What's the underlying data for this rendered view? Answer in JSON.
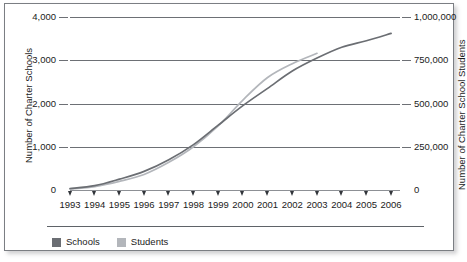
{
  "chart_data": {
    "type": "line",
    "title": "",
    "xlabel": "",
    "ylabel": "Number of Charter Schools",
    "y2label": "Number of Charter School Students",
    "grid": true,
    "legend_position": "bottom-left",
    "x": [
      1993,
      1994,
      1995,
      1996,
      1997,
      1998,
      1999,
      2000,
      2001,
      2002,
      2003,
      2004,
      2005,
      2006
    ],
    "xticklabels": [
      "1993",
      "1994",
      "1995",
      "1996",
      "1997",
      "1998",
      "1999",
      "2000",
      "2001",
      "2002",
      "2003",
      "2004",
      "2005",
      "2006"
    ],
    "ylim": [
      0,
      4000
    ],
    "yticks": [
      0,
      1000,
      2000,
      3000,
      4000
    ],
    "yticklabels": [
      "0",
      "1,000",
      "2,000",
      "3,000",
      "4,000"
    ],
    "y2lim": [
      0,
      1000000
    ],
    "y2ticks": [
      0,
      250000,
      500000,
      750000,
      1000000
    ],
    "y2ticklabels": [
      "0",
      "250,000",
      "500,000",
      "750,000",
      "1,000,000"
    ],
    "series": [
      {
        "name": "Schools",
        "axis": "left",
        "color": "#6b6e73",
        "values": [
          35,
          100,
          250,
          430,
          700,
          1050,
          1500,
          1950,
          2350,
          2750,
          3050,
          3300,
          3450,
          3620
        ]
      },
      {
        "name": "Students",
        "axis": "right",
        "color": "#b3b6bb",
        "values": [
          5000,
          20000,
          50000,
          90000,
          160000,
          250000,
          370000,
          520000,
          650000,
          730000,
          790000,
          null,
          null,
          null
        ]
      }
    ],
    "legend": [
      {
        "label": "Schools",
        "color": "#6b6e73"
      },
      {
        "label": "Students",
        "color": "#b3b6bb"
      }
    ]
  },
  "colors": {
    "frame_border": "#7b7e83",
    "gridline": "#6d7075",
    "text": "#1b1b1b",
    "background": "#ffffff"
  }
}
